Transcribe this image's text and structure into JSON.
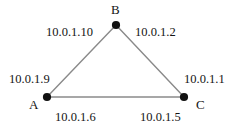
{
  "diagram": {
    "type": "network-triangle-topology",
    "background_color": "#ffffff",
    "node_color": "#111111",
    "edge_color": "#8a8a8a",
    "text_color": "#141414",
    "nodes": [
      {
        "id": "B",
        "label": "B",
        "x": 116,
        "y": 25
      },
      {
        "id": "A",
        "label": "A",
        "x": 47,
        "y": 97
      },
      {
        "id": "C",
        "label": "C",
        "x": 184,
        "y": 97
      }
    ],
    "edges": [
      {
        "id": "edge-a-b",
        "from": "A",
        "to": "B"
      },
      {
        "id": "edge-b-c",
        "from": "B",
        "to": "C"
      },
      {
        "id": "edge-a-c",
        "from": "A",
        "to": "C"
      }
    ],
    "interface_labels": {
      "b_left": "10.0.1.10",
      "b_right": "10.0.1.2",
      "a_upper": "10.0.1.9",
      "c_upper": "10.0.1.1",
      "a_lower": "10.0.1.6",
      "c_lower": "10.0.1.5"
    }
  }
}
